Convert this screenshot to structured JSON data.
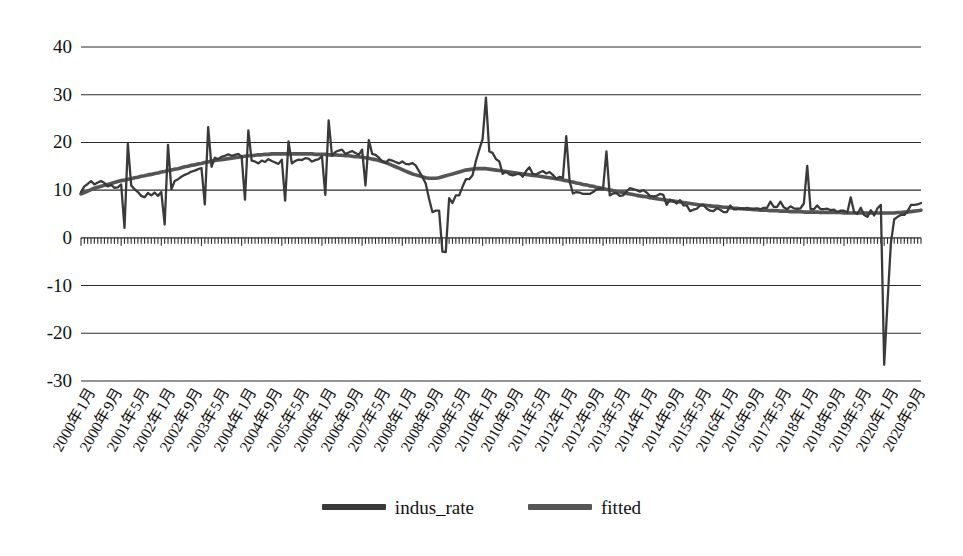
{
  "chart_data": {
    "type": "line",
    "title": "",
    "xlabel": "",
    "ylabel": "",
    "ylim": [
      -30,
      40
    ],
    "ytick_values": [
      40,
      30,
      20,
      10,
      0,
      -10,
      -20,
      -30
    ],
    "ytick_labels": [
      "40",
      "30",
      "20",
      "10",
      "0",
      "-10",
      "-20",
      "-30"
    ],
    "grid": true,
    "legend_position": "bottom-center",
    "xtick_labels": [
      "2000年1月",
      "2000年9月",
      "2001年5月",
      "2002年1月",
      "2002年9月",
      "2003年5月",
      "2004年1月",
      "2004年9月",
      "2005年5月",
      "2006年1月",
      "2006年9月",
      "2007年5月",
      "2008年1月",
      "2008年9月",
      "2009年5月",
      "2010年1月",
      "2010年9月",
      "2011年5月",
      "2012年1月",
      "2012年9月",
      "2013年5月",
      "2014年1月",
      "2014年9月",
      "2015年5月",
      "2016年1月",
      "2016年9月",
      "2017年5月",
      "2018年1月",
      "2018年9月",
      "2019年5月",
      "2020年1月",
      "2020年9月"
    ],
    "xtick_interval_months": 8,
    "x_start_label": "2000年1月",
    "x_end_label": "2020年12月",
    "series": [
      {
        "name": "indus_rate",
        "color": "#3a3a3a",
        "values": [
          9.6,
          10.8,
          11.3,
          11.9,
          11.2,
          11.6,
          11.9,
          11.5,
          10.8,
          11.1,
          10.5,
          10.6,
          11.2,
          2.1,
          19.7,
          11.0,
          10.2,
          9.6,
          8.8,
          8.5,
          9.4,
          8.9,
          9.5,
          8.8,
          9.6,
          2.8,
          19.5,
          10.2,
          11.9,
          12.3,
          12.8,
          13.2,
          13.5,
          13.9,
          14.1,
          14.4,
          14.6,
          7.0,
          23.2,
          14.9,
          16.8,
          16.5,
          17.0,
          17.2,
          17.5,
          17.2,
          17.4,
          17.6,
          17.0,
          8.0,
          22.5,
          16.2,
          16.0,
          15.6,
          16.2,
          15.9,
          16.5,
          16.1,
          15.8,
          15.5,
          16.4,
          7.8,
          20.2,
          15.6,
          16.1,
          16.4,
          16.3,
          16.7,
          16.6,
          16.0,
          16.3,
          16.5,
          17.1,
          9.0,
          24.6,
          17.2,
          18.0,
          18.3,
          18.5,
          17.6,
          17.9,
          18.2,
          17.8,
          17.4,
          18.5,
          11.0,
          20.5,
          17.6,
          17.4,
          16.8,
          16.0,
          15.7,
          16.4,
          16.2,
          15.9,
          15.6,
          16.0,
          15.5,
          15.4,
          15.7,
          15.2,
          14.0,
          12.8,
          11.4,
          8.2,
          5.4,
          5.7,
          5.7,
          -2.9,
          -3.0,
          8.3,
          7.3,
          8.9,
          8.9,
          10.7,
          12.3,
          12.3,
          13.1,
          16.1,
          18.5,
          20.7,
          29.4,
          18.1,
          17.8,
          16.5,
          16.0,
          13.4,
          13.9,
          13.3,
          13.1,
          13.3,
          13.5,
          12.8,
          14.0,
          14.8,
          13.4,
          13.3,
          13.7,
          14.0,
          13.5,
          13.8,
          13.2,
          12.4,
          12.8,
          12.6,
          21.3,
          11.9,
          9.3,
          9.6,
          9.5,
          9.2,
          9.2,
          9.2,
          9.6,
          10.1,
          10.3,
          10.3,
          18.1,
          8.9,
          9.3,
          9.4,
          8.8,
          8.9,
          9.7,
          10.4,
          10.2,
          10.0,
          9.7,
          10.0,
          9.5,
          8.8,
          8.7,
          8.8,
          9.2,
          9.0,
          6.9,
          8.0,
          7.7,
          7.2,
          7.9,
          6.8,
          6.8,
          5.6,
          5.9,
          6.1,
          6.8,
          6.9,
          6.1,
          5.7,
          5.6,
          6.2,
          5.9,
          5.4,
          5.4,
          6.8,
          6.0,
          6.0,
          6.2,
          6.0,
          6.3,
          6.1,
          6.1,
          6.2,
          6.0,
          6.3,
          6.3,
          7.6,
          6.5,
          6.5,
          7.6,
          6.4,
          6.0,
          6.6,
          6.2,
          6.1,
          6.2,
          7.2,
          15.1,
          6.0,
          6.0,
          6.8,
          6.0,
          6.0,
          6.1,
          5.8,
          5.9,
          5.4,
          5.7,
          5.7,
          5.3,
          8.5,
          5.4,
          5.0,
          6.3,
          4.8,
          4.4,
          5.8,
          4.7,
          6.2,
          6.9,
          -26.6,
          -13.5,
          -1.1,
          3.9,
          4.4,
          4.8,
          4.8,
          5.6,
          6.9,
          6.9,
          7.0,
          7.3
        ]
      },
      {
        "name": "fitted",
        "color": "#555555",
        "values": [
          9.2,
          9.5,
          9.8,
          10.1,
          10.4,
          10.6,
          10.8,
          11.0,
          11.2,
          11.4,
          11.6,
          11.8,
          12.0,
          12.1,
          12.3,
          12.4,
          12.6,
          12.7,
          12.9,
          13.0,
          13.2,
          13.3,
          13.5,
          13.6,
          13.8,
          13.9,
          14.1,
          14.2,
          14.4,
          14.5,
          14.7,
          14.9,
          15.0,
          15.2,
          15.3,
          15.5,
          15.6,
          15.8,
          15.9,
          16.1,
          16.2,
          16.3,
          16.4,
          16.5,
          16.6,
          16.7,
          16.8,
          16.9,
          17.0,
          17.1,
          17.2,
          17.2,
          17.3,
          17.4,
          17.4,
          17.5,
          17.5,
          17.6,
          17.6,
          17.6,
          17.6,
          17.6,
          17.6,
          17.6,
          17.6,
          17.6,
          17.6,
          17.6,
          17.6,
          17.6,
          17.5,
          17.5,
          17.5,
          17.5,
          17.4,
          17.4,
          17.4,
          17.3,
          17.3,
          17.2,
          17.2,
          17.1,
          17.0,
          17.0,
          16.9,
          16.8,
          16.7,
          16.5,
          16.4,
          16.2,
          16.0,
          15.8,
          15.5,
          15.2,
          14.9,
          14.6,
          14.3,
          14.0,
          13.7,
          13.4,
          13.2,
          13.0,
          12.8,
          12.6,
          12.5,
          12.5,
          12.5,
          12.6,
          12.8,
          13.0,
          13.2,
          13.4,
          13.6,
          13.8,
          14.0,
          14.2,
          14.3,
          14.4,
          14.5,
          14.5,
          14.5,
          14.5,
          14.4,
          14.3,
          14.2,
          14.1,
          14.0,
          13.9,
          13.8,
          13.7,
          13.6,
          13.5,
          13.4,
          13.3,
          13.2,
          13.1,
          13.0,
          12.9,
          12.8,
          12.7,
          12.6,
          12.5,
          12.4,
          12.3,
          12.1,
          12.0,
          11.8,
          11.7,
          11.5,
          11.4,
          11.2,
          11.1,
          10.9,
          10.8,
          10.6,
          10.5,
          10.3,
          10.2,
          10.0,
          9.9,
          9.7,
          9.6,
          9.5,
          9.3,
          9.2,
          9.1,
          8.9,
          8.8,
          8.7,
          8.6,
          8.4,
          8.3,
          8.2,
          8.1,
          8.0,
          7.9,
          7.8,
          7.7,
          7.6,
          7.5,
          7.4,
          7.3,
          7.2,
          7.1,
          7.0,
          6.9,
          6.9,
          6.8,
          6.7,
          6.6,
          6.6,
          6.5,
          6.4,
          6.4,
          6.3,
          6.2,
          6.2,
          6.1,
          6.1,
          6.0,
          6.0,
          5.9,
          5.9,
          5.8,
          5.8,
          5.8,
          5.7,
          5.7,
          5.7,
          5.6,
          5.6,
          5.6,
          5.5,
          5.5,
          5.5,
          5.5,
          5.4,
          5.4,
          5.4,
          5.4,
          5.4,
          5.3,
          5.3,
          5.3,
          5.3,
          5.3,
          5.3,
          5.3,
          5.2,
          5.2,
          5.2,
          5.2,
          5.2,
          5.2,
          5.2,
          5.2,
          5.2,
          5.2,
          5.2,
          5.2,
          5.2,
          5.2,
          5.2,
          5.2,
          5.3,
          5.3,
          5.4,
          5.4,
          5.5,
          5.6,
          5.7,
          5.8
        ]
      }
    ]
  },
  "legend": {
    "entries": [
      {
        "label": "indus_rate",
        "color": "#3a3a3a"
      },
      {
        "label": "fitted",
        "color": "#555555"
      }
    ]
  }
}
